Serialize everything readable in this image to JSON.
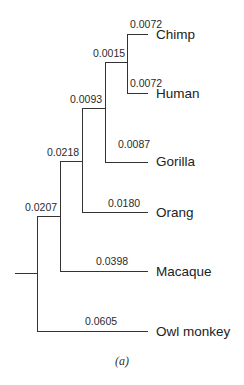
{
  "figure": {
    "caption": "(a)",
    "type": "phylogenetic-tree"
  },
  "taxa": {
    "chimp": "Chimp",
    "human": "Human",
    "gorilla": "Gorilla",
    "orang": "Orang",
    "macaque": "Macaque",
    "owl_monkey": "Owl monkey"
  },
  "branch_lengths": {
    "chimp": "0.0072",
    "human": "0.0072",
    "chimp_human_node": "0.0015",
    "gorilla": "0.0087",
    "african_ape_node": "0.0093",
    "orang": "0.0180",
    "great_ape_node": "0.0218",
    "macaque": "0.0398",
    "catarrhine_node": "0.0207",
    "owl_monkey": "0.0605"
  }
}
